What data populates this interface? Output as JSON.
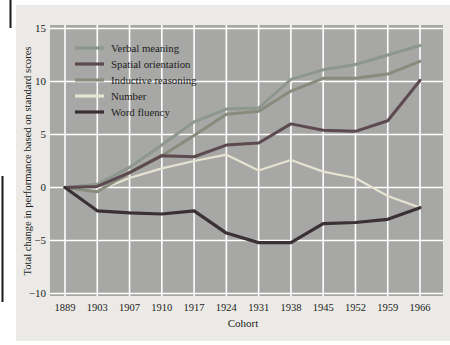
{
  "figure": {
    "x_axis_title": "Cohort",
    "y_axis_title": "Total change in performance based on standard scores"
  },
  "colors": {
    "figure_background": "#ebeae6",
    "panel_background": "#a7a7a5",
    "gridline": "#ffffff",
    "text": "#1c1c1c",
    "page_rule": "#1a1a1a"
  },
  "chart_data": {
    "type": "line",
    "title": "",
    "xlabel": "Cohort",
    "ylabel": "Total change in performance based on standard scores",
    "x_categories": [
      "1889",
      "1903",
      "1907",
      "1910",
      "1917",
      "1924",
      "1931",
      "1938",
      "1945",
      "1952",
      "1959",
      "1966"
    ],
    "y_ticks": [
      15,
      10,
      5,
      0,
      -5,
      -10
    ],
    "ylim": [
      -10,
      15
    ],
    "grid": true,
    "legend_position": "top-left-inside",
    "series": [
      {
        "name": "Verbal meaning",
        "color": "#8e978e",
        "width": 3.0,
        "values": [
          0,
          0.3,
          1.9,
          4.0,
          6.2,
          7.4,
          7.5,
          10.2,
          11.1,
          11.6,
          12.5,
          13.4
        ]
      },
      {
        "name": "Spatial orientation",
        "color": "#5c4a50",
        "width": 3.0,
        "values": [
          0,
          0.1,
          1.4,
          3.0,
          2.9,
          4.0,
          4.2,
          6.0,
          5.4,
          5.3,
          6.3,
          10.1
        ]
      },
      {
        "name": "Inductive reasoning",
        "color": "#878c7c",
        "width": 3.0,
        "values": [
          0,
          -0.4,
          1.4,
          3.0,
          4.9,
          6.9,
          7.2,
          9.1,
          10.3,
          10.3,
          10.7,
          11.9
        ]
      },
      {
        "name": "Number",
        "color": "#e6e3d1",
        "width": 2.2,
        "values": [
          0,
          -0.3,
          0.9,
          1.8,
          2.5,
          3.1,
          1.6,
          2.6,
          1.5,
          0.9,
          -0.8,
          -1.9
        ]
      },
      {
        "name": "Word fluency",
        "color": "#3a3036",
        "width": 3.2,
        "values": [
          0,
          -2.2,
          -2.4,
          -2.5,
          -2.2,
          -4.3,
          -5.2,
          -5.2,
          -3.4,
          -3.3,
          -3.0,
          -1.9
        ]
      }
    ],
    "draw_order": [
      3,
      0,
      2,
      1,
      4
    ]
  }
}
